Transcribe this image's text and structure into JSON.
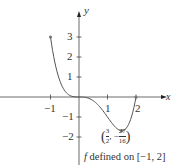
{
  "chart_data": {
    "type": "line",
    "title": "",
    "function": "x^4 - 2x^3",
    "xlabel": "x",
    "ylabel": "y",
    "x_ticks": [
      -1,
      1,
      2
    ],
    "x_tick_labels": [
      "-1",
      "1",
      "2"
    ],
    "y_ticks": [
      3,
      2,
      1,
      -1,
      -2
    ],
    "y_tick_labels": [
      "3",
      "2",
      "1",
      "−1",
      "−2"
    ],
    "xlim": [
      -2.0,
      3.1
    ],
    "ylim": [
      -2.9,
      4.2
    ],
    "grid": false,
    "domain": [
      -1,
      2
    ],
    "x": [
      -1,
      -0.75,
      -0.5,
      -0.25,
      0,
      0.25,
      0.5,
      0.75,
      1,
      1.25,
      1.5,
      1.75,
      2
    ],
    "values": [
      3,
      1.16,
      0.3125,
      0.035,
      0,
      -0.027,
      -0.1875,
      -0.527,
      -1,
      -1.465,
      -1.6875,
      -1.3,
      0
    ],
    "marked_points": [
      {
        "x": -1,
        "y": 3
      },
      {
        "x": 1.5,
        "y": -1.6875
      },
      {
        "x": 2,
        "y": 0
      }
    ],
    "annotations": [
      {
        "text": "(3/2, −27/16)",
        "x": 1.5,
        "y": -1.6875
      },
      {
        "text": "f defined on [−1, 2]"
      }
    ],
    "color": "#555555"
  },
  "labels": {
    "x_axis": "x",
    "y_axis": "y",
    "xt_m1": "−1",
    "xt_1": "1",
    "xt_2": "2",
    "yt_3": "3",
    "yt_2": "2",
    "yt_1": "1",
    "yt_m1": "−1",
    "yt_m2": "−2",
    "point_num1": "3",
    "point_den1": "2",
    "point_sep": ", −",
    "point_num2": "27",
    "point_den2": "16",
    "caption_f": "f",
    "caption_rest": " defined on [−1, 2]"
  }
}
